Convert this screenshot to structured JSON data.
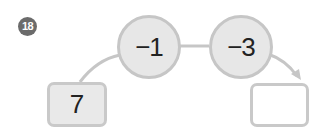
{
  "problem": {
    "number": "18"
  },
  "diagram": {
    "start_value": "7",
    "operations": [
      {
        "label": "−1"
      },
      {
        "label": "−3"
      }
    ],
    "result_value": ""
  },
  "colors": {
    "badge": "#6b6b6b",
    "circle_fill": "#e7e7e7",
    "stroke": "#c6c6c6",
    "start_box_fill": "#e9e9e9",
    "text": "#222222"
  }
}
